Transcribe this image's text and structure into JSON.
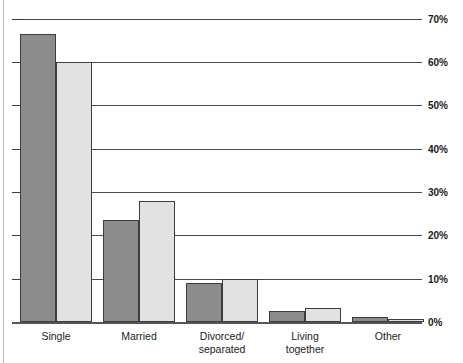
{
  "chart_data": {
    "type": "bar",
    "title": "",
    "subtitle": "",
    "xlabel": "",
    "ylabel": "",
    "ylim": [
      0,
      70
    ],
    "grid": true,
    "legend": null,
    "tick_suffix": "%",
    "categories": [
      "Single",
      "Married",
      "Divorced/\nseparated",
      "Living\ntogether",
      "Other"
    ],
    "ytick_labels": [
      "0%",
      "10%",
      "20%",
      "30%",
      "40%",
      "50%",
      "60%",
      "70%"
    ],
    "ytick_values": [
      0,
      10,
      20,
      30,
      40,
      50,
      60,
      70
    ],
    "series": [
      {
        "name": "Series 1",
        "color": "#8c8c8c",
        "values": [
          66.5,
          23.5,
          9.0,
          2.5,
          1.2
        ]
      },
      {
        "name": "Series 2",
        "color": "#e2e2e2",
        "values": [
          60.0,
          28.0,
          10.0,
          3.2,
          0.8
        ]
      }
    ]
  }
}
